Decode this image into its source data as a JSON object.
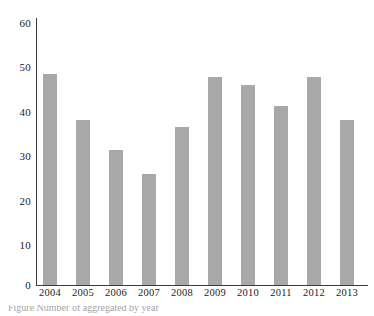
{
  "chart_data": {
    "type": "bar",
    "title": "",
    "subtitle": "",
    "xlabel": "",
    "ylabel": "",
    "categories": [
      "2004",
      "2005",
      "2006",
      "2007",
      "2008",
      "2009",
      "2010",
      "2011",
      "2012",
      "2013"
    ],
    "values": [
      47.5,
      37.2,
      30.3,
      25.0,
      35.6,
      46.7,
      45.0,
      40.3,
      46.7,
      37.1
    ],
    "series": [
      {
        "name": "",
        "values": [
          47.5,
          37.2,
          30.3,
          25.0,
          35.6,
          46.7,
          45.0,
          40.3,
          46.7,
          37.1
        ]
      }
    ],
    "ylim": [
      0,
      60
    ],
    "y_ticks": [
      0,
      10,
      20,
      30,
      40,
      50,
      60
    ],
    "y_tick_labels": [
      "0",
      "10",
      "20",
      "30",
      "40",
      "50",
      "60"
    ],
    "x_tick_labels": [
      "2004",
      "2005",
      "2006",
      "2007",
      "2008",
      "2009",
      "2010",
      "2011",
      "2012",
      "2013"
    ],
    "grid": false,
    "legend": false,
    "legend_position": "none",
    "bar_color": "#a8a8a8",
    "axis_color": "#3a3a3a",
    "text_color": "#1c1c1c",
    "background": "#ffffff",
    "annotations": []
  },
  "caption": {
    "text": "Figure   Number of                 aggregated by year"
  }
}
